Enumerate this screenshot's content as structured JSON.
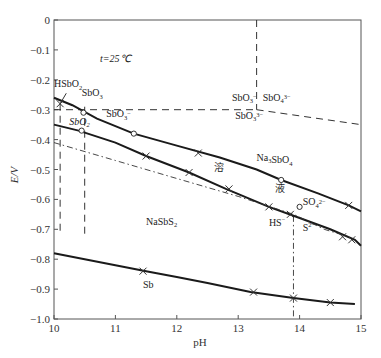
{
  "chart_data": {
    "type": "line",
    "title": "",
    "annotation": "t=25℃",
    "xlabel": "pH",
    "ylabel": "E/V",
    "xlim": [
      10,
      15
    ],
    "ylim": [
      -1.0,
      0
    ],
    "grid": false,
    "legend": null,
    "x_ticks": [
      "10",
      "11",
      "12",
      "13",
      "14",
      "15"
    ],
    "y_ticks": [
      "0",
      "-0.1",
      "-0.2",
      "-0.3",
      "-0.4",
      "-0.5",
      "-0.6",
      "-0.7",
      "-0.8",
      "-0.9",
      "-1.0"
    ],
    "series": [
      {
        "name": "upper boundary (SbO3- / Na3SbO4 vs solution)",
        "style": "solid",
        "x": [
          10.0,
          10.3,
          10.7,
          11.3,
          12.0,
          12.7,
          13.3,
          13.7,
          14.3,
          14.8,
          15.0
        ],
        "y": [
          -0.26,
          -0.285,
          -0.33,
          -0.38,
          -0.42,
          -0.46,
          -0.5,
          -0.535,
          -0.58,
          -0.62,
          -0.64
        ]
      },
      {
        "name": "middle boundary (SbO2- / NaSbS2 vs solution)",
        "style": "solid",
        "x": [
          10.0,
          10.4,
          11.0,
          11.5,
          12.2,
          12.8,
          13.5,
          13.9,
          14.5,
          14.9,
          15.0
        ],
        "y": [
          -0.35,
          -0.37,
          -0.41,
          -0.455,
          -0.51,
          -0.565,
          -0.625,
          -0.655,
          -0.7,
          -0.735,
          -0.755
        ]
      },
      {
        "name": "HS-/S2- / SO4 2- boundary",
        "style": "dashdot",
        "x": [
          10.0,
          11.0,
          12.0,
          13.0,
          13.9,
          14.4,
          14.8
        ],
        "y": [
          -0.41,
          -0.47,
          -0.53,
          -0.59,
          -0.65,
          -0.7,
          -0.725
        ]
      },
      {
        "name": "Sb / NaSbS2 boundary",
        "style": "solid",
        "x": [
          10.0,
          11.0,
          11.5,
          12.0,
          12.5,
          13.2,
          13.9,
          14.5,
          14.9
        ],
        "y": [
          -0.78,
          -0.82,
          -0.84,
          -0.86,
          -0.88,
          -0.91,
          -0.93,
          -0.945,
          -0.95
        ]
      }
    ],
    "dashed_boundaries": [
      {
        "x": [
          10.0,
          15.0
        ],
        "y": [
          -0.3,
          -0.3
        ],
        "note": "SbO3- horizontal to pH 13.3"
      },
      {
        "x": [
          13.3,
          15.0
        ],
        "y": [
          -0.3,
          -0.35
        ]
      },
      {
        "x": [
          13.3,
          13.3
        ],
        "y": [
          0.0,
          -0.3
        ]
      },
      {
        "x": [
          10.1,
          10.1
        ],
        "y": [
          -0.28,
          -0.71
        ]
      },
      {
        "x": [
          10.5,
          10.5
        ],
        "y": [
          -0.29,
          -0.725
        ]
      }
    ],
    "dashdot_vertical": {
      "x": [
        13.9,
        13.9
      ],
      "y": [
        -0.655,
        -1.0
      ]
    },
    "markers": {
      "circle": [
        [
          10.48,
          -0.31
        ],
        [
          10.45,
          -0.37
        ],
        [
          11.3,
          -0.38
        ],
        [
          13.7,
          -0.535
        ],
        [
          14.0,
          -0.625
        ]
      ],
      "cross": [
        [
          10.1,
          -0.28
        ],
        [
          11.5,
          -0.455
        ],
        [
          12.35,
          -0.445
        ],
        [
          12.2,
          -0.51
        ],
        [
          12.85,
          -0.565
        ],
        [
          13.5,
          -0.625
        ],
        [
          13.85,
          -0.65
        ],
        [
          14.8,
          -0.62
        ],
        [
          14.7,
          -0.725
        ],
        [
          14.85,
          -0.735
        ],
        [
          11.45,
          -0.84
        ],
        [
          13.25,
          -0.91
        ],
        [
          13.9,
          -0.93
        ],
        [
          14.5,
          -0.945
        ]
      ]
    },
    "region_labels": [
      {
        "text": "t=25℃",
        "x": 10.75,
        "y": -0.14
      },
      {
        "text": "HSbO2",
        "x": 10.0,
        "y": -0.225
      },
      {
        "text": "SbO3",
        "x": 10.45,
        "y": -0.255
      },
      {
        "text": "SbO2",
        "x": 10.25,
        "y": -0.35
      },
      {
        "text": "SbO3-",
        "x": 10.85,
        "y": -0.325
      },
      {
        "text": "SbO3-",
        "x": 12.9,
        "y": -0.27
      },
      {
        "text": "SbO4 3-",
        "x": 13.4,
        "y": -0.27
      },
      {
        "text": "SbO3 3-",
        "x": 12.95,
        "y": -0.33
      },
      {
        "text": "Na3SbO4",
        "x": 13.3,
        "y": -0.47
      },
      {
        "text": "溶",
        "x": 12.6,
        "y": -0.505
      },
      {
        "text": "液",
        "x": 13.6,
        "y": -0.575
      },
      {
        "text": "SO4 2-",
        "x": 14.05,
        "y": -0.62
      },
      {
        "text": "HS-",
        "x": 13.5,
        "y": -0.69
      },
      {
        "text": "S2-",
        "x": 14.05,
        "y": -0.705
      },
      {
        "text": "NaSbS2",
        "x": 11.5,
        "y": -0.685
      },
      {
        "text": "Sb",
        "x": 11.45,
        "y": -0.895
      }
    ]
  },
  "labels": {
    "x_axis_title": "pH",
    "y_axis_title": "E/V",
    "temperature": "t=25℃"
  }
}
